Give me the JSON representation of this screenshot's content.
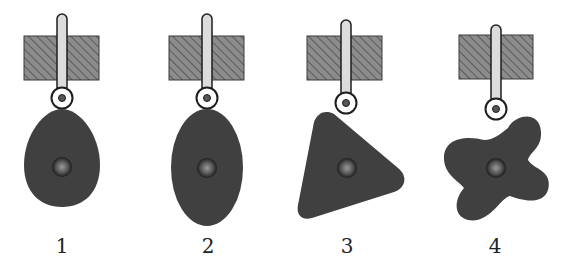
{
  "figure": {
    "colors": {
      "cam_fill": "#404040",
      "block_fill": "#8c8c8c",
      "hatch_line": "#5a5a5a",
      "rod_fill": "#dcdcdc",
      "outline": "#1e1e1e",
      "bearing_center": "#9a9a9a",
      "bearing_edge": "#1c1c1c"
    },
    "mechanisms": [
      {
        "label": "1",
        "cam_shape": "egg"
      },
      {
        "label": "2",
        "cam_shape": "ellipse"
      },
      {
        "label": "3",
        "cam_shape": "rounded-triangle"
      },
      {
        "label": "4",
        "cam_shape": "four-lobed-star"
      }
    ]
  }
}
